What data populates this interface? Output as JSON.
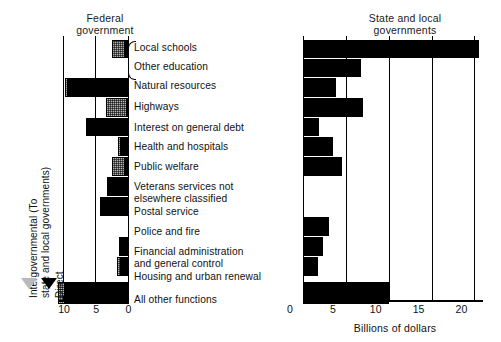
{
  "chart_data": {
    "type": "bar",
    "xlabel": "Billions of dollars",
    "ylabel": "",
    "panels": [
      {
        "name": "federal",
        "title": "Federal\ngovernment",
        "direction": "right-to-left",
        "xlim": [
          0,
          11
        ],
        "ticks": [
          10,
          5,
          0
        ],
        "tick_labels": [
          "10",
          "5",
          "0"
        ],
        "grid": true,
        "series": [
          {
            "name": "Direct",
            "key": "direct",
            "color": "#000000"
          },
          {
            "name": "Intergovernmental (To state and local governments)",
            "key": "intergov",
            "color": "#b4b4b4"
          }
        ]
      },
      {
        "name": "state_and_local",
        "title": "State and local\ngovernments",
        "direction": "left-to-right",
        "xlim": [
          0,
          21
        ],
        "ticks": [
          0,
          5,
          10,
          15,
          20
        ],
        "tick_labels": [
          "0",
          "5",
          "10",
          "15",
          "20"
        ],
        "grid": true,
        "series": [
          {
            "name": "Direct",
            "key": "direct",
            "color": "#000000"
          }
        ]
      }
    ],
    "categories": [
      "Local schools",
      "Other education",
      "Natural resources",
      "Highways",
      "Interest on general debt",
      "Health and hospitals",
      "Public welfare",
      "Veterans services not\nelsewhere classified",
      "Postal service",
      "Police and fire",
      "Financial administration\nand general control",
      "Housing and urban renewal",
      "All other functions"
    ],
    "federal": {
      "direct": [
        0.6,
        0.0,
        9.3,
        0.2,
        6.6,
        1.2,
        0.5,
        3.3,
        4.4,
        0.0,
        1.5,
        1.1,
        9.9
      ],
      "intergov": [
        1.9,
        0.0,
        0.5,
        3.3,
        0.0,
        0.4,
        2.0,
        0.0,
        0.0,
        0.0,
        0.0,
        0.7,
        1.0
      ]
    },
    "state_and_local": {
      "direct": [
        20.5,
        6.8,
        3.8,
        7.0,
        1.9,
        3.5,
        4.5,
        0.0,
        0.0,
        3.0,
        2.3,
        1.8,
        10.0
      ]
    }
  },
  "titles": {
    "federal_line1": "Federal",
    "federal_line2": "government",
    "state_line1": "State and local",
    "state_line2": "governments"
  },
  "axis": {
    "xlabel": "Billions of dollars",
    "federal_ticks": [
      "10",
      "5",
      "0"
    ],
    "state_ticks": [
      "0",
      "5",
      "10",
      "15",
      "20"
    ]
  },
  "legend": {
    "intergov_line1": "Intergovernmental (To",
    "intergov_line2": "state and local governments)",
    "direct": "Direct"
  },
  "labels": [
    "Local schools",
    "Other education",
    "Natural resources",
    "Highways",
    "Interest on general debt",
    "Health and hospitals",
    "Public welfare",
    "Veterans services not\nelsewhere classified",
    "Postal service",
    "Police and fire",
    "Financial administration\nand general control",
    "Housing and urban renewal",
    "All other functions"
  ]
}
